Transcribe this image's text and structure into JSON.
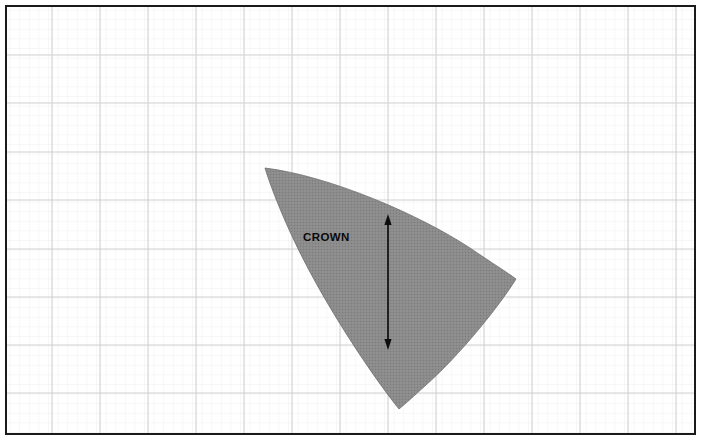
{
  "figure": {
    "title": "CROWN",
    "background_color": "#ffffff",
    "frame": {
      "border_color": "#1a1a1a",
      "border_width": 2,
      "x": 6,
      "y": 6,
      "width": 689,
      "height": 428
    },
    "grid": {
      "major_color": "#cfcfcf",
      "minor_color": "#e7e7e7",
      "major_spacing": 48,
      "minor_spacing": 9.6,
      "origin_x": 4,
      "origin_y": 6,
      "visible": true
    },
    "labels": [
      {
        "name": "crown-label",
        "text": "CROWN",
        "x": 303,
        "y": 232,
        "bold": true,
        "color": "#0a0a0a",
        "font_size": 11.5
      }
    ],
    "shapes": [
      {
        "name": "crown-region",
        "kind": "filled-curved-sail",
        "fill_color": "#8b8b8b",
        "stroke_color": "#6f6f6f",
        "apex_top_left": [
          265,
          168
        ],
        "vertex_right": [
          516,
          279
        ],
        "vertex_bottom": [
          399,
          409
        ]
      }
    ],
    "annotations": [
      {
        "name": "crown-height-dimension",
        "kind": "double-headed-arrow",
        "orientation": "vertical",
        "color": "#0d0d0d",
        "x": 388,
        "y_top": 215,
        "y_bottom": 349
      }
    ]
  }
}
